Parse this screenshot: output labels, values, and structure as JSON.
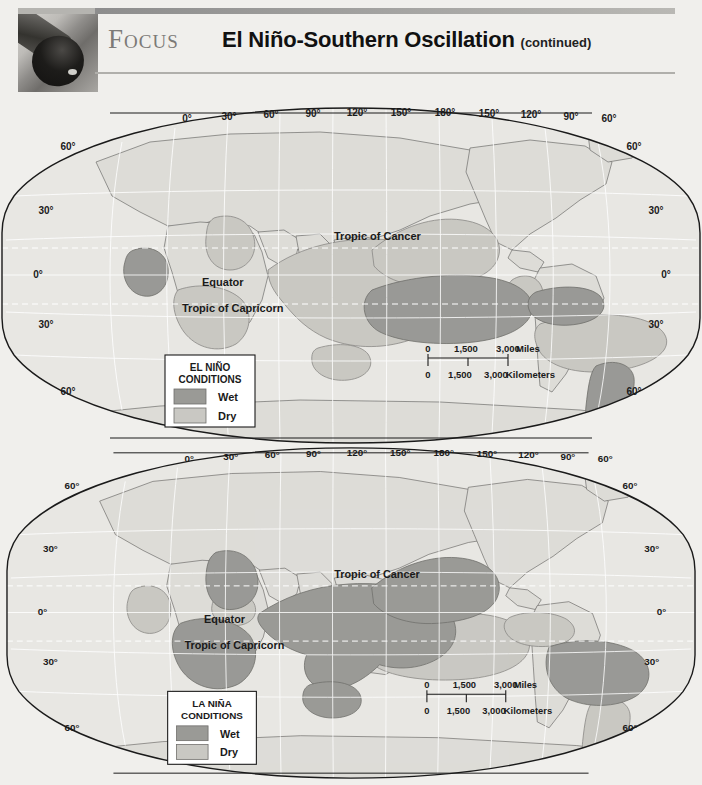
{
  "header": {
    "kicker": "Focus",
    "title": "El Niño-Southern Oscillation",
    "continued": "(continued)",
    "photo_alt": "telescope-lens-photo"
  },
  "colors": {
    "page_background": "#f0efec",
    "ocean": "#e8e7e3",
    "land": "#dededa",
    "wet": "#9a9a96",
    "dry": "#c9c8c3",
    "outline": "#1a1a1a",
    "graticule": "#ffffff",
    "kicker_gray": "#7c7a77"
  },
  "maps": [
    {
      "id": "el-nino",
      "legend": {
        "title_line1": "EL NIÑO",
        "title_line2": "CONDITIONS",
        "items": [
          {
            "label": "Wet",
            "swatch": "#9a9a96"
          },
          {
            "label": "Dry",
            "swatch": "#c9c8c3"
          }
        ]
      },
      "longitude_labels": [
        "0°",
        "30°",
        "60°",
        "90°",
        "120°",
        "150°",
        "180°",
        "150°",
        "120°",
        "90°",
        "60°"
      ],
      "latitude_labels_left": [
        "60°",
        "30°",
        "0°",
        "30°",
        "60°"
      ],
      "latitude_labels_right": [
        "60°",
        "30°",
        "0°",
        "30°",
        "60°"
      ],
      "place_labels": [
        "Tropic of Cancer",
        "Equator",
        "Tropic of Capricorn"
      ],
      "scale": {
        "miles": {
          "ticks": [
            "0",
            "1,500",
            "3,000"
          ],
          "unit": "Miles"
        },
        "kilometers": {
          "ticks": [
            "0",
            "1,500",
            "3,000"
          ],
          "unit": "Kilometers"
        }
      },
      "regions": [
        {
          "name": "east-africa-horn",
          "condition": "Wet"
        },
        {
          "name": "southern-africa",
          "condition": "Dry"
        },
        {
          "name": "india-south-asia",
          "condition": "Dry"
        },
        {
          "name": "maritime-continent-australia",
          "condition": "Dry"
        },
        {
          "name": "central-equatorial-pacific",
          "condition": "Wet"
        },
        {
          "name": "north-pacific-to-japan",
          "condition": "Dry"
        },
        {
          "name": "southwest-usa-mexico",
          "condition": "Dry"
        },
        {
          "name": "gulf-coast-southeast-usa",
          "condition": "Wet"
        },
        {
          "name": "northern-south-america-caribbean",
          "condition": "Dry"
        },
        {
          "name": "southern-south-america",
          "condition": "Wet"
        }
      ]
    },
    {
      "id": "la-nina",
      "legend": {
        "title_line1": "LA NIÑA",
        "title_line2": "CONDITIONS",
        "items": [
          {
            "label": "Wet",
            "swatch": "#9a9a96"
          },
          {
            "label": "Dry",
            "swatch": "#c9c8c3"
          }
        ]
      },
      "longitude_labels": [
        "0°",
        "30°",
        "60°",
        "90°",
        "120°",
        "150°",
        "180°",
        "150°",
        "120°",
        "90°",
        "60°"
      ],
      "latitude_labels_left": [
        "60°",
        "30°",
        "0°",
        "30°",
        "60°"
      ],
      "latitude_labels_right": [
        "60°",
        "30°",
        "0°",
        "30°",
        "60°"
      ],
      "place_labels": [
        "Tropic of Cancer",
        "Equator",
        "Tropic of Capricorn"
      ],
      "scale": {
        "miles": {
          "ticks": [
            "0",
            "1,500",
            "3,000"
          ],
          "unit": "Miles"
        },
        "kilometers": {
          "ticks": [
            "0",
            "1,500",
            "3,000"
          ],
          "unit": "Kilometers"
        }
      },
      "regions": [
        {
          "name": "east-africa-horn",
          "condition": "Dry"
        },
        {
          "name": "southern-africa",
          "condition": "Wet"
        },
        {
          "name": "india-south-asia",
          "condition": "Wet"
        },
        {
          "name": "maritime-continent-australia",
          "condition": "Wet"
        },
        {
          "name": "central-equatorial-pacific",
          "condition": "Dry"
        },
        {
          "name": "north-pacific-to-japan",
          "condition": "Wet"
        },
        {
          "name": "southwest-usa-mexico",
          "condition": "Dry"
        },
        {
          "name": "gulf-coast-southeast-usa",
          "condition": "Dry"
        },
        {
          "name": "northern-south-america-caribbean",
          "condition": "Wet"
        },
        {
          "name": "southern-south-america",
          "condition": "Dry"
        }
      ]
    }
  ]
}
